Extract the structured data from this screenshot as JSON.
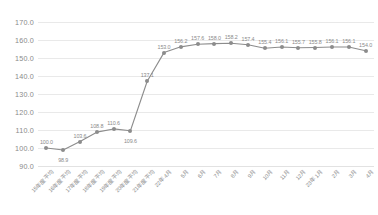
{
  "chart_data": {
    "type": "line",
    "title": "",
    "subtitle": "",
    "xlabel": "",
    "ylabel": "",
    "ylim": [
      90.0,
      170.0
    ],
    "ytick_step": 10.0,
    "yticks": [
      "170.0",
      "160.0",
      "150.0",
      "140.0",
      "130.0",
      "120.0",
      "110.0",
      "100.0",
      "90.0"
    ],
    "grid": true,
    "legend": false,
    "legend_position": "none",
    "marker": "circle",
    "data_labels": true,
    "categories": [
      "15年度平均",
      "16年度平均",
      "17年度平均",
      "18年度平均",
      "19年度平均",
      "20年度平均",
      "21年度平均",
      "22年 4月",
      "5月",
      "6月",
      "7月",
      "8月",
      "9月",
      "10月",
      "11月",
      "12月",
      "23年 1月",
      "2月",
      "3月",
      "4月"
    ],
    "values": [
      100.0,
      98.9,
      103.6,
      108.8,
      110.6,
      109.6,
      137.1,
      153.0,
      156.2,
      157.6,
      158.0,
      158.2,
      157.4,
      155.4,
      156.1,
      155.7,
      155.8,
      156.1,
      156.1,
      154.0
    ],
    "point_labels": [
      "100.0",
      "98.9",
      "103.6",
      "108.8",
      "110.6",
      "109.6",
      "137.1",
      "153.0",
      "156.2",
      "157.6",
      "158.0",
      "158.2",
      "157.4",
      "155.4",
      "156.1",
      "155.7",
      "155.8",
      "156.1",
      "156.1",
      "154.0"
    ],
    "label_offsets": [
      "above",
      "below",
      "above",
      "above",
      "above",
      "below",
      "above",
      "above",
      "above",
      "above",
      "above",
      "above",
      "above",
      "above",
      "above",
      "above",
      "above",
      "above",
      "above",
      "above"
    ],
    "colors": {
      "line": "#8c8c8c",
      "marker": "#8c8c8c",
      "grid": "#e9e9e9",
      "text": "#8a8a8a",
      "background": "#ffffff"
    }
  },
  "caption": {
    "text": ""
  }
}
